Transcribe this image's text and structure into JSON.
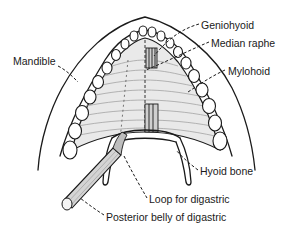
{
  "figure": {
    "colors": {
      "line": "#1a1a1a",
      "muscle_fill": "#e9e9e9",
      "background": "#ffffff"
    }
  },
  "labels": [
    {
      "id": "mandible",
      "text": "Mandible",
      "x": 13,
      "y": 55
    },
    {
      "id": "geniohyoid",
      "text": "Geniohyoid",
      "x": 201,
      "y": 19
    },
    {
      "id": "median-raphe",
      "text": "Median raphe",
      "x": 211,
      "y": 37
    },
    {
      "id": "mylohoid",
      "text": "Mylohoid",
      "x": 228,
      "y": 65
    },
    {
      "id": "hyoid-bone",
      "text": "Hyoid bone",
      "x": 200,
      "y": 165
    },
    {
      "id": "loop-for-digastric",
      "text": "Loop for digastric",
      "x": 149,
      "y": 194
    },
    {
      "id": "posterior-belly-of-digastric",
      "text": "Posterior belly of digastric",
      "x": 106,
      "y": 212
    }
  ]
}
